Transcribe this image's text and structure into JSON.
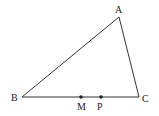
{
  "figure": {
    "type": "triangle",
    "stroke_color": "#333333",
    "vertices": {
      "A": {
        "label": "A",
        "x": 119,
        "y": 17,
        "label_x": 118,
        "label_y": 13
      },
      "B": {
        "label": "B",
        "x": 22,
        "y": 97,
        "label_x": 11,
        "label_y": 101
      },
      "C": {
        "label": "C",
        "x": 139,
        "y": 97,
        "label_x": 142,
        "label_y": 102
      }
    },
    "points_on_BC": [
      {
        "label": "M",
        "x": 81,
        "y": 97,
        "label_x": 77,
        "label_y": 110
      },
      {
        "label": "P",
        "x": 101,
        "y": 97,
        "label_x": 97,
        "label_y": 110
      }
    ]
  }
}
